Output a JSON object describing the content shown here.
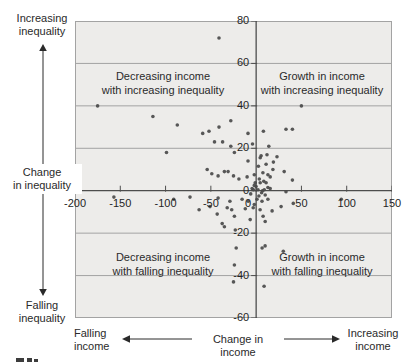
{
  "chart_data": {
    "type": "scatter",
    "title": "",
    "x_axis": {
      "annotation": "Change in income",
      "neg_annotation": {
        "line1": "Falling",
        "line2": "income"
      },
      "pos_annotation": {
        "line1": "Increasing",
        "line2": "income"
      },
      "ticks": [
        -200,
        -150,
        -100,
        -50,
        0,
        50,
        100,
        150
      ],
      "range": [
        -200,
        150
      ],
      "gridlines": false
    },
    "y_axis": {
      "annotation": {
        "line1": "Change",
        "line2": "in inequality"
      },
      "pos_annotation": {
        "line1": "Increasing",
        "line2": "inequality"
      },
      "neg_annotation": {
        "line1": "Falling",
        "line2": "inequality"
      },
      "ticks": [
        80,
        60,
        40,
        20,
        0,
        -20,
        -40,
        -60
      ],
      "range": [
        -60,
        80
      ],
      "gridlines": true
    },
    "quadrant_labels": {
      "top_left": {
        "line1": "Decreasing income",
        "line2": "with increasing inequality"
      },
      "top_right": {
        "line1": "Growth in income",
        "line2": "with increasing inequality"
      },
      "bottom_left": {
        "line1": "Decreasing income",
        "line2": "with falling inequality"
      },
      "bottom_right": {
        "line1": "Growth in income",
        "line2": "with falling inequality"
      }
    },
    "colors": {
      "plot_bg": "#edecea",
      "gridline": "#a3a3a3",
      "axis": "#4d4d4d",
      "dot": "#4a4a4a",
      "text": "#2a2a2a"
    },
    "points": [
      [
        -175,
        40
      ],
      [
        -157,
        -3
      ],
      [
        -114,
        35
      ],
      [
        -99,
        18
      ],
      [
        -91,
        -4
      ],
      [
        -87,
        31
      ],
      [
        -73,
        -3
      ],
      [
        -63,
        -9
      ],
      [
        -59,
        27
      ],
      [
        -54,
        10
      ],
      [
        -52,
        28
      ],
      [
        -51,
        -7.5
      ],
      [
        -49,
        8
      ],
      [
        -46,
        23
      ],
      [
        -43,
        -11
      ],
      [
        -42,
        7
      ],
      [
        -42,
        -3.5
      ],
      [
        -41,
        30
      ],
      [
        -41,
        72
      ],
      [
        -37,
        23
      ],
      [
        -37.5,
        -15.5
      ],
      [
        -35,
        9
      ],
      [
        -35,
        -17
      ],
      [
        -32,
        -8
      ],
      [
        -31,
        9
      ],
      [
        -29,
        -5
      ],
      [
        -28,
        33
      ],
      [
        -28,
        21
      ],
      [
        -27,
        -9
      ],
      [
        -25,
        7
      ],
      [
        -24,
        18
      ],
      [
        -24,
        -12
      ],
      [
        -23,
        -18.5
      ],
      [
        -22,
        -27
      ],
      [
        -24,
        -35
      ],
      [
        -25,
        -43
      ],
      [
        -19,
        5.5
      ],
      [
        -15.5,
        -4
      ],
      [
        -12,
        -8.5
      ],
      [
        -10,
        6.5
      ],
      [
        -9,
        27
      ],
      [
        -9,
        14
      ],
      [
        -8.8,
        -5
      ],
      [
        -6.6,
        -13.6
      ],
      [
        -6,
        -1.5
      ],
      [
        -4.5,
        1
      ],
      [
        -4,
        22
      ],
      [
        -3.3,
        -8
      ],
      [
        -3,
        0.5
      ],
      [
        -2,
        7.5
      ],
      [
        -2,
        2.5
      ],
      [
        -2,
        -6.5
      ],
      [
        -1,
        3.8
      ],
      [
        0,
        2
      ],
      [
        1,
        -4
      ],
      [
        2,
        0.5
      ],
      [
        2.5,
        11.5
      ],
      [
        3,
        -2.5
      ],
      [
        3.5,
        5.5
      ],
      [
        4.4,
        -9
      ],
      [
        4.5,
        15.5
      ],
      [
        4.5,
        3.8
      ],
      [
        5.5,
        16.5
      ],
      [
        6,
        -1
      ],
      [
        6.5,
        -5
      ],
      [
        6.6,
        -27
      ],
      [
        7,
        0
      ],
      [
        7.5,
        8.5
      ],
      [
        7.7,
        -12
      ],
      [
        8,
        28
      ],
      [
        8.5,
        4.5
      ],
      [
        8.8,
        -45
      ],
      [
        9,
        0.5
      ],
      [
        9.9,
        -26
      ],
      [
        10,
        -2
      ],
      [
        10,
        -14.5
      ],
      [
        11,
        12.5
      ],
      [
        11,
        3.8
      ],
      [
        12,
        17
      ],
      [
        13,
        7.5
      ],
      [
        13,
        1.5
      ],
      [
        13,
        -4
      ],
      [
        14,
        21
      ],
      [
        15.5,
        6.5
      ],
      [
        15.5,
        1
      ],
      [
        17.6,
        -9.5
      ],
      [
        18.5,
        10
      ],
      [
        19,
        13.5
      ],
      [
        23,
        16
      ],
      [
        27.6,
        -7.5
      ],
      [
        30,
        -28.5
      ],
      [
        31,
        9
      ],
      [
        33,
        29
      ],
      [
        33,
        -0.5
      ],
      [
        40,
        29
      ],
      [
        40,
        5
      ],
      [
        41,
        -6
      ],
      [
        50,
        40
      ],
      [
        94,
        -4
      ]
    ]
  }
}
